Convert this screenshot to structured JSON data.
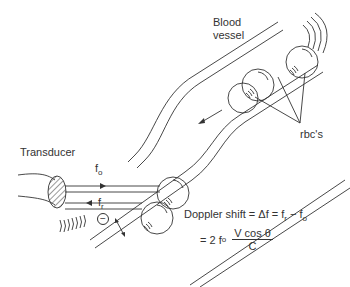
{
  "labels": {
    "blood_vessel_line1": "Blood",
    "blood_vessel_line2": "vessel",
    "rbcs": "rbc's",
    "transducer": "Transducer",
    "f_o": "f",
    "f_o_sub": "o",
    "f_r": "f",
    "f_r_sub": "r",
    "minus_sign": "−"
  },
  "equation": {
    "line1": "Doppler shift = Δf = f",
    "line1_sub_r": "r",
    "line1_minus": " − f",
    "line1_sub_o": "o",
    "line2_prefix": "= 2 f",
    "line2_sub_o": "o",
    "numerator": "V cos θ",
    "denominator": "C"
  },
  "colors": {
    "ink": "#333333",
    "background": "#ffffff"
  }
}
